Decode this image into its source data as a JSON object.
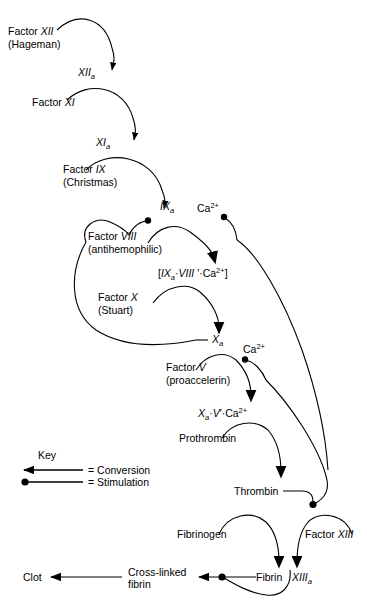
{
  "diagram": {
    "width": 367,
    "height": 608,
    "background": "#ffffff",
    "ink": "#000000"
  },
  "nodes": {
    "factor_xii": {
      "line1": "Factor ",
      "line1_italic": "XII",
      "line2": "(Hageman)"
    },
    "xiia": {
      "base": "XII",
      "sub": "a"
    },
    "factor_xi": {
      "text": "Factor ",
      "italic": "XI"
    },
    "xia": {
      "base": "XI",
      "sub": "a"
    },
    "factor_ix": {
      "line1": "Factor ",
      "line1_italic": "IX",
      "line2": "(Christmas)"
    },
    "ixa": {
      "base": "IX",
      "sub": "a"
    },
    "factor_viii": {
      "line1": "Factor ",
      "line1_italic": "VIII",
      "line2": "(antihemophilic)"
    },
    "calcium_1": {
      "base": "Ca",
      "sup": "2+"
    },
    "complex_ixa_viii_ca": {
      "open": "[",
      "ixa_base": "IX",
      "ixa_sub": "a",
      "dot1": "·",
      "viii": "VIII ",
      "prime": "′",
      "dot2": "·",
      "ca_base": "Ca",
      "ca_sup": "2+",
      "close": "]"
    },
    "factor_x": {
      "line1": "Factor ",
      "line1_italic": "X",
      "line2": "(Stuart)"
    },
    "xa": {
      "base": "X",
      "sub": "a"
    },
    "calcium_2": {
      "base": "Ca",
      "sup": "2+"
    },
    "factor_v": {
      "line1": "Factor ",
      "line1_italic": "V",
      "line2": "(proaccelerin)"
    },
    "complex_xa_v_ca": {
      "xa_base": "X",
      "xa_sub": "a",
      "dot1": "·",
      "v": "V",
      "prime": "′",
      "dot2": "·",
      "ca_base": "Ca",
      "ca_sup": "2+"
    },
    "prothrombin": {
      "text": "Prothrombin"
    },
    "thrombin": {
      "text": "Thrombin"
    },
    "fibrinogen": {
      "text": "Fibrinogen"
    },
    "factor_xiii": {
      "text": "Factor ",
      "italic": "XIII"
    },
    "fibrin": {
      "text": "Fibrin"
    },
    "xiiia": {
      "base": "XIII",
      "sub": "a"
    },
    "cross_linked_fibrin": {
      "line1": "Cross-linked",
      "line2": "fibrin"
    },
    "clot": {
      "text": "Clot"
    }
  },
  "key": {
    "title": "Key",
    "conversion_label": "= Conversion",
    "stimulation_label": "= Stimulation"
  }
}
